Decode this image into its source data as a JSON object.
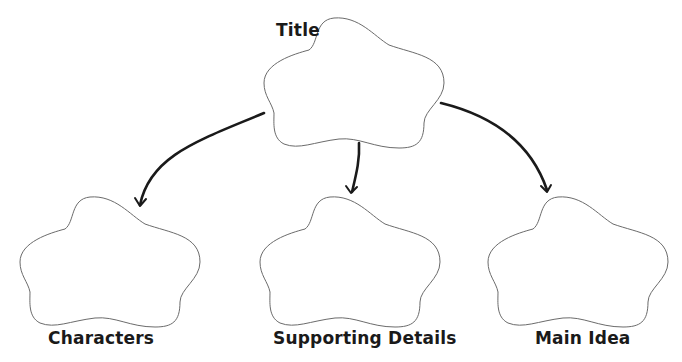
{
  "diagram": {
    "type": "graphic-organizer",
    "nodes": [
      {
        "id": "title",
        "label": "Title",
        "position": "top-center"
      },
      {
        "id": "characters",
        "label": "Characters",
        "position": "bottom-left"
      },
      {
        "id": "supporting",
        "label": "Supporting Details",
        "position": "bottom-center"
      },
      {
        "id": "main",
        "label": "Main Idea",
        "position": "bottom-right"
      }
    ],
    "edges": [
      {
        "from": "title",
        "to": "characters"
      },
      {
        "from": "title",
        "to": "supporting"
      },
      {
        "from": "title",
        "to": "main"
      }
    ],
    "colors": {
      "outline": "#6b6b6b",
      "arrow": "#1a1a1a",
      "text": "#1a1a1a",
      "background": "#ffffff"
    }
  }
}
